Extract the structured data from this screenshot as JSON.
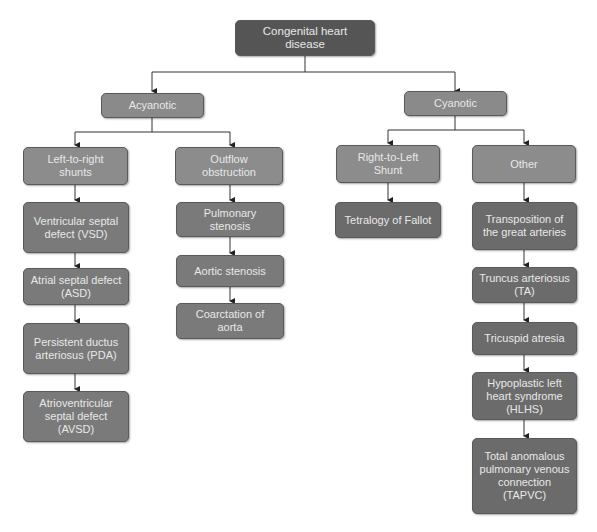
{
  "diagram": {
    "title": "Congenital heart disease",
    "root": {
      "label": "Congenital heart disease"
    },
    "acyanotic": {
      "label": "Acyanotic",
      "left_to_right": {
        "label": "Left-to-right shunts",
        "items": [
          "Ventricular septal defect (VSD)",
          "Atrial septal defect (ASD)",
          "Persistent ductus arteriosus (PDA)",
          "Atrioventricular septal defect (AVSD)"
        ]
      },
      "outflow": {
        "label": "Outflow obstruction",
        "items": [
          "Pulmonary stenosis",
          "Aortic stenosis",
          "Coarctation of aorta"
        ]
      }
    },
    "cyanotic": {
      "label": "Cyanotic",
      "right_to_left": {
        "label": "Right-to-Left Shunt",
        "items": [
          "Tetralogy of Fallot"
        ]
      },
      "other": {
        "label": "Other",
        "items": [
          "Transposition of the great arteries",
          "Truncus arteriosus (TA)",
          "Tricuspid atresia",
          "Hypoplastic left heart syndrome (HLHS)",
          "Total anomalous pulmonary venous connection (TAPVC)"
        ]
      }
    }
  }
}
